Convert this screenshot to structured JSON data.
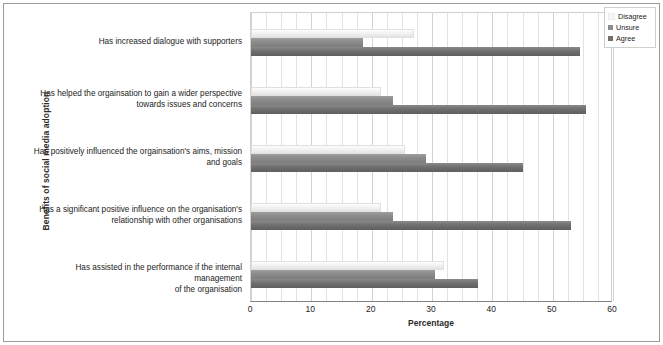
{
  "chart_data": {
    "type": "bar",
    "orientation": "horizontal",
    "title": "",
    "xlabel": "Percentage",
    "ylabel": "Benefits of social media adoption",
    "xlim": [
      0,
      60
    ],
    "xticks": [
      0,
      10,
      20,
      30,
      40,
      50,
      60
    ],
    "grid": true,
    "legend_position": "top-right",
    "categories": [
      "Has increased dialogue with supporters",
      "Has helped the orgainsation to gain a wider perspective towards issues and concerns",
      "Has positively influenced the orgainsation's aims, mission and goals",
      "Has a significant positive influence on the organisation's relationship with other organisations",
      "Has assisted in the performance if the internal management of the organisation"
    ],
    "series": [
      {
        "name": "Disagree",
        "color": "#f2f2f2",
        "values": [
          27.0,
          21.5,
          25.5,
          21.5,
          32.0
        ]
      },
      {
        "name": "Unsure",
        "color": "#8c8c8c",
        "values": [
          18.5,
          23.5,
          29.0,
          23.5,
          30.5
        ]
      },
      {
        "name": "Agree",
        "color": "#6f6f6f",
        "values": [
          54.5,
          55.5,
          45.0,
          53.0,
          37.7
        ]
      }
    ]
  },
  "category_label_lines": [
    [
      "Has increased dialogue with supporters"
    ],
    [
      "Has helped the orgainsation to gain a wider perspective",
      "towards issues and concerns"
    ],
    [
      "Has positively influenced the orgainsation's aims, mission",
      "and goals"
    ],
    [
      "Has a significant positive influence on the organisation's",
      "relationship with other organisations"
    ],
    [
      "Has assisted in the performance if the internal management",
      "of the organisation"
    ]
  ],
  "legend": {
    "items": [
      {
        "label": "Disagree",
        "color": "#f7f7f7"
      },
      {
        "label": "Unsure",
        "color": "#8c8c8c"
      },
      {
        "label": "Agree",
        "color": "#6f6f6f"
      }
    ]
  },
  "axis": {
    "x_title": "Percentage",
    "y_title": "Benefits of social media adoption",
    "x_tick_labels": [
      "0",
      "10",
      "20",
      "30",
      "40",
      "50",
      "60"
    ]
  }
}
